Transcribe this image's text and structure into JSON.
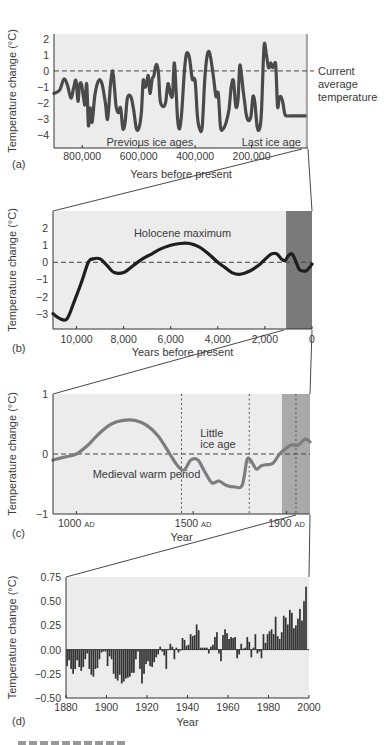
{
  "figure": {
    "caption_partial": "FIGURE 15.x",
    "colors": {
      "plot_bg": "#ececec",
      "curve_dark": "#4a4a4a",
      "curve_black": "#1e1e1e",
      "curve_grey": "#7d7d7d",
      "strip_light": "#a9a9a9",
      "strip_dark": "#7a7a7a",
      "bars": "#333333"
    }
  },
  "chart_data": [
    {
      "id": "a",
      "panel_label": "(a)",
      "type": "line",
      "title": "",
      "xlabel": "Years before present",
      "ylabel": "Temperature change (°C)",
      "xlim": [
        900000,
        0
      ],
      "ylim": [
        -5,
        3
      ],
      "xticks": [
        800000,
        600000,
        400000,
        200000
      ],
      "xtick_labels": [
        "800,000",
        "600,000",
        "400,000",
        "200,000"
      ],
      "yticks": [
        2,
        1,
        0,
        -1,
        -2,
        -3,
        -4
      ],
      "ytick_labels": [
        "2",
        "1",
        "0",
        "−1",
        "−2",
        "−3",
        "−4"
      ],
      "reference_line": {
        "y": 0,
        "label": [
          "Current",
          "average",
          "temperature"
        ]
      },
      "annotations": [
        {
          "text": "Previous ice ages",
          "x": 560000,
          "y": -4.4
        },
        {
          "text": "Last ice age",
          "x": 130000,
          "y": -4.4
        }
      ],
      "highlight_region": {
        "x0": 8000,
        "x1": 0,
        "note": "expanded in (b)"
      },
      "x": [
        900000,
        880000,
        865000,
        852000,
        840000,
        830000,
        822000,
        815000,
        810000,
        803000,
        796000,
        790000,
        784000,
        778000,
        772000,
        765000,
        755000,
        742000,
        730000,
        718000,
        710000,
        700000,
        692000,
        686000,
        680000,
        672000,
        664000,
        656000,
        648000,
        640000,
        628000,
        618000,
        608000,
        598000,
        590000,
        584000,
        578000,
        572000,
        566000,
        560000,
        552000,
        546000,
        538000,
        530000,
        524000,
        515000,
        505000,
        496000,
        488000,
        480000,
        474000,
        468000,
        462000,
        455000,
        447000,
        438000,
        430000,
        420000,
        410000,
        400000,
        392000,
        384000,
        375000,
        366000,
        358000,
        350000,
        342000,
        334000,
        326000,
        318000,
        310000,
        300000,
        290000,
        280000,
        272000,
        264000,
        256000,
        248000,
        242000,
        236000,
        230000,
        224000,
        218000,
        210000,
        202000,
        195000,
        188000,
        180000,
        172000,
        165000,
        156000,
        148000,
        140000,
        132000,
        126000,
        120000,
        114000,
        108000,
        102000,
        96000,
        90000,
        82000,
        74000,
        66000,
        58000,
        50000,
        40000,
        30000,
        20000,
        10000
      ],
      "y": [
        -1.4,
        -1.2,
        -0.5,
        -0.9,
        -1.7,
        -1.0,
        -0.6,
        -1.9,
        -0.9,
        -0.8,
        -1.6,
        -2.1,
        -0.8,
        -3.4,
        -2.3,
        -3.2,
        -1.5,
        -0.6,
        -0.8,
        -2.0,
        -3.0,
        -0.9,
        0.0,
        -1.0,
        -2.2,
        -2.6,
        -2.3,
        -3.6,
        -3.2,
        -1.7,
        -1.6,
        -2.4,
        -3.6,
        -3.5,
        -2.5,
        -0.6,
        -1.0,
        -0.8,
        -0.3,
        -1.4,
        -0.5,
        -0.3,
        0.4,
        -0.1,
        -1.8,
        -2.2,
        -2.0,
        -0.8,
        -1.4,
        -1.5,
        0.5,
        -1.0,
        -3.0,
        -3.6,
        -2.5,
        0.0,
        1.1,
        0.8,
        -0.5,
        -0.6,
        -2.8,
        -3.6,
        -3.5,
        -0.6,
        0.9,
        1.2,
        0.5,
        -0.5,
        -1.6,
        -1.4,
        -3.5,
        -3.6,
        -3.2,
        -2.4,
        -1.0,
        -0.6,
        -2.2,
        -1.8,
        0.3,
        -0.2,
        -1.2,
        -2.0,
        -2.8,
        -3.1,
        -2.8,
        -1.6,
        -2.0,
        -3.5,
        -3.6,
        -2.6,
        1.5,
        1.1,
        0.2,
        0.5,
        0.2,
        0.4,
        0.3,
        -2.2,
        -1.7,
        -1.6,
        -1.9,
        -2.7,
        -2.8,
        -2.8,
        -2.8,
        -2.8,
        -2.8,
        -2.8,
        -2.8,
        -2.8
      ]
    },
    {
      "id": "b",
      "panel_label": "(b)",
      "type": "line",
      "title": "",
      "xlabel": "Years before present",
      "ylabel": "Temperature change (°C)",
      "xlim": [
        11000,
        0
      ],
      "ylim": [
        -4,
        3
      ],
      "xticks": [
        10000,
        8000,
        6000,
        4000,
        2000,
        0
      ],
      "xtick_labels": [
        "10,000",
        "8,000",
        "6,000",
        "4,000",
        "2,000",
        "0"
      ],
      "yticks": [
        2,
        1,
        0,
        -1,
        -2,
        -3
      ],
      "ytick_labels": [
        "2",
        "1",
        "0",
        "−1",
        "−2",
        "−3"
      ],
      "reference_line": {
        "y": 0
      },
      "annotations": [
        {
          "text": "Holocene maximum",
          "x": 5500,
          "y": 1.7
        }
      ],
      "highlight_region": {
        "x0": 1100,
        "x1": 0,
        "note": "expanded in (c)"
      },
      "x": [
        11000,
        10700,
        10400,
        10100,
        9800,
        9500,
        9300,
        9000,
        8700,
        8400,
        8000,
        7600,
        7200,
        6800,
        6400,
        6000,
        5600,
        5200,
        4800,
        4400,
        4000,
        3700,
        3400,
        3100,
        2800,
        2500,
        2200,
        1900,
        1700,
        1500,
        1300,
        1150,
        1000,
        850,
        700,
        550,
        400,
        250,
        100,
        0
      ],
      "y": [
        -3.0,
        -3.3,
        -3.3,
        -2.3,
        -1.2,
        0.0,
        0.2,
        0.2,
        -0.2,
        -0.6,
        -0.6,
        -0.2,
        0.2,
        0.5,
        0.8,
        1.0,
        1.1,
        1.1,
        0.9,
        0.5,
        0.0,
        -0.3,
        -0.6,
        -0.7,
        -0.6,
        -0.4,
        -0.1,
        0.3,
        0.5,
        0.5,
        0.2,
        0.1,
        0.4,
        0.5,
        0.1,
        -0.4,
        -0.5,
        -0.5,
        -0.3,
        -0.1
      ]
    },
    {
      "id": "c",
      "panel_label": "(c)",
      "type": "line",
      "title": "",
      "xlabel": "Year",
      "ylabel": "Temperature change (°C)",
      "xlim": [
        900,
        2000
      ],
      "ylim": [
        -1,
        1
      ],
      "xticks": [
        1000,
        1500,
        1900
      ],
      "xtick_labels": [
        "1000 AD",
        "1500 AD",
        "1900 AD"
      ],
      "yticks": [
        1,
        0,
        -1
      ],
      "ytick_labels": [
        "1",
        "0",
        "−1"
      ],
      "reference_line": {
        "y": 0
      },
      "vertical_markers": [
        1450,
        1740,
        1940
      ],
      "annotations": [
        {
          "text": "Medieval warm period",
          "x": 1070,
          "y": -0.33
        },
        {
          "text": "Little",
          "x": 1530,
          "y": 0.35
        },
        {
          "text": "ice age",
          "x": 1530,
          "y": 0.16
        }
      ],
      "highlight_region": {
        "x0": 1880,
        "x1": 2000,
        "note": "expanded in (d)"
      },
      "x": [
        900,
        950,
        1000,
        1050,
        1100,
        1150,
        1200,
        1250,
        1300,
        1350,
        1400,
        1430,
        1460,
        1490,
        1520,
        1550,
        1580,
        1610,
        1640,
        1680,
        1710,
        1730,
        1745,
        1770,
        1790,
        1810,
        1840,
        1870,
        1900,
        1920,
        1950,
        1980,
        2000
      ],
      "y": [
        -0.1,
        -0.05,
        0.0,
        0.15,
        0.35,
        0.5,
        0.56,
        0.56,
        0.48,
        0.3,
        0.0,
        -0.18,
        -0.27,
        -0.1,
        -0.1,
        -0.3,
        -0.48,
        -0.45,
        -0.52,
        -0.55,
        -0.52,
        -0.1,
        -0.1,
        -0.25,
        -0.2,
        -0.18,
        -0.16,
        0.0,
        0.1,
        0.15,
        0.15,
        0.25,
        0.2
      ]
    },
    {
      "id": "d",
      "panel_label": "(d)",
      "type": "bar",
      "title": "",
      "xlabel": "Year",
      "ylabel": "Temperature change (°C)",
      "xlim": [
        1880,
        2000
      ],
      "ylim": [
        -0.5,
        0.75
      ],
      "xticks": [
        1880,
        1900,
        1920,
        1940,
        1960,
        1980,
        2000
      ],
      "xtick_labels": [
        "1880",
        "1900",
        "1920",
        "1940",
        "1960",
        "1980",
        "2000"
      ],
      "yticks": [
        0.75,
        0.5,
        0.25,
        0.0,
        -0.25,
        -0.5
      ],
      "ytick_labels": [
        "0.75",
        "0.50",
        "0.25",
        "0.00",
        "−0.25",
        "−0.50"
      ],
      "categories": [
        1880,
        1881,
        1882,
        1883,
        1884,
        1885,
        1886,
        1887,
        1888,
        1889,
        1890,
        1891,
        1892,
        1893,
        1894,
        1895,
        1896,
        1897,
        1898,
        1899,
        1900,
        1901,
        1902,
        1903,
        1904,
        1905,
        1906,
        1907,
        1908,
        1909,
        1910,
        1911,
        1912,
        1913,
        1914,
        1915,
        1916,
        1917,
        1918,
        1919,
        1920,
        1921,
        1922,
        1923,
        1924,
        1925,
        1926,
        1927,
        1928,
        1929,
        1930,
        1931,
        1932,
        1933,
        1934,
        1935,
        1936,
        1937,
        1938,
        1939,
        1940,
        1941,
        1942,
        1943,
        1944,
        1945,
        1946,
        1947,
        1948,
        1949,
        1950,
        1951,
        1952,
        1953,
        1954,
        1955,
        1956,
        1957,
        1958,
        1959,
        1960,
        1961,
        1962,
        1963,
        1964,
        1965,
        1966,
        1967,
        1968,
        1969,
        1970,
        1971,
        1972,
        1973,
        1974,
        1975,
        1976,
        1977,
        1978,
        1979,
        1980,
        1981,
        1982,
        1983,
        1984,
        1985,
        1986,
        1987,
        1988,
        1989,
        1990,
        1991,
        1992,
        1993,
        1994,
        1995,
        1996,
        1997,
        1998
      ],
      "values": [
        -0.17,
        -0.11,
        -0.2,
        -0.25,
        -0.2,
        -0.11,
        -0.18,
        -0.22,
        -0.18,
        -0.1,
        -0.04,
        -0.2,
        -0.26,
        -0.28,
        -0.2,
        -0.19,
        -0.1,
        -0.03,
        -0.02,
        -0.02,
        -0.17,
        -0.07,
        -0.1,
        -0.25,
        -0.3,
        -0.32,
        -0.26,
        -0.35,
        -0.33,
        -0.3,
        -0.29,
        -0.28,
        -0.24,
        -0.24,
        -0.1,
        -0.02,
        -0.2,
        -0.35,
        -0.25,
        -0.15,
        -0.12,
        -0.17,
        -0.18,
        -0.13,
        -0.08,
        -0.05,
        0.03,
        -0.02,
        -0.06,
        -0.2,
        0.0,
        0.06,
        0.03,
        -0.1,
        0.02,
        -0.03,
        -0.01,
        0.12,
        0.1,
        0.04,
        0.05,
        0.16,
        0.14,
        0.15,
        0.26,
        0.2,
        0.02,
        0.02,
        0.02,
        0.02,
        -0.04,
        0.03,
        0.05,
        0.13,
        0.18,
        -0.04,
        -0.12,
        0.15,
        0.21,
        0.17,
        0.11,
        0.13,
        0.12,
        0.13,
        -0.09,
        -0.05,
        0.06,
        0.01,
        0.02,
        0.13,
        0.08,
        -0.08,
        0.02,
        0.16,
        -0.04,
        -0.02,
        -0.09,
        0.16,
        0.07,
        0.16,
        0.19,
        0.21,
        0.16,
        0.34,
        0.14,
        0.11,
        0.18,
        0.35,
        0.33,
        0.26,
        0.41,
        0.38,
        0.22,
        0.25,
        0.32,
        0.42,
        0.3,
        0.5,
        0.65
      ]
    }
  ]
}
